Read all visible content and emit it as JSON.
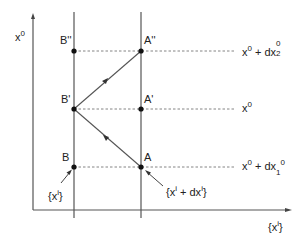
{
  "diagram": {
    "colors": {
      "line": "#555555",
      "dash": "#666666",
      "point": "#111111",
      "text": "#222222",
      "background": "#ffffff"
    },
    "axes": {
      "vertical_label": {
        "base": "x",
        "sup": "0"
      },
      "horizontal_label": {
        "open": "{x",
        "sup": "i",
        "close": "}"
      }
    },
    "vertical_lines": [
      {
        "id": "B-line",
        "x": 74
      },
      {
        "id": "A-line",
        "x": 141
      }
    ],
    "points": [
      {
        "name": "B''",
        "label": "B''",
        "x": 74,
        "y": 51
      },
      {
        "name": "A''",
        "label": "A''",
        "x": 141,
        "y": 51
      },
      {
        "name": "B'",
        "label": "B'",
        "x": 74,
        "y": 109
      },
      {
        "name": "A'",
        "label": "A'",
        "x": 141,
        "y": 109
      },
      {
        "name": "B",
        "label": "B",
        "x": 74,
        "y": 167
      },
      {
        "name": "A",
        "label": "A",
        "x": 141,
        "y": 167
      }
    ],
    "levels": [
      {
        "id": "level-top",
        "y": 51,
        "label": {
          "base": "x",
          "sup": "0",
          "plus": " + dx",
          "sub": "2",
          "sup2": "0"
        }
      },
      {
        "id": "level-mid",
        "y": 109,
        "label": {
          "base": "x",
          "sup": "0"
        }
      },
      {
        "id": "level-bottom",
        "y": 167,
        "label": {
          "base": "x",
          "sup": "0",
          "plus": " + dx",
          "sub": "1",
          "sup2": "0"
        }
      }
    ],
    "annotations": {
      "xi": {
        "open": "{x",
        "sup": "i",
        "close": "}"
      },
      "xi_dxi": {
        "open": "{x",
        "sup": "i",
        "mid": " + dx",
        "sup2": "i",
        "close": "}"
      }
    },
    "paths": [
      {
        "from": "A",
        "to": "B'",
        "direction": "A→B'"
      },
      {
        "from": "B'",
        "to": "A''",
        "direction": "B'→A''"
      }
    ]
  }
}
